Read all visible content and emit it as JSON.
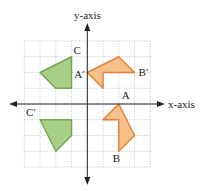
{
  "diagram": {
    "type": "coordinate-plane-transformations",
    "axes": {
      "x_label": "x-axis",
      "y_label": "y-axis",
      "x_range": [
        -4,
        4
      ],
      "y_range": [
        -4,
        4
      ]
    },
    "grid": {
      "cells_x": 8,
      "cells_y": 8,
      "style": "dotted"
    },
    "colors": {
      "green_fill": "#a8cf87",
      "green_stroke": "#6ea84a",
      "orange_fill": "#f5c08a",
      "orange_stroke": "#e57f35",
      "axis": "#222222",
      "grid": "#b8b8b8"
    },
    "shapes": [
      {
        "name": "green-shape-top",
        "color": "green",
        "points": [
          [
            -1,
            3
          ],
          [
            -3,
            2
          ],
          [
            -2,
            1
          ],
          [
            -1,
            1
          ]
        ]
      },
      {
        "name": "orange-shape-top",
        "color": "orange",
        "points": [
          [
            0,
            2
          ],
          [
            2,
            3
          ],
          [
            3,
            2
          ],
          [
            1,
            2
          ],
          [
            1,
            1
          ]
        ]
      },
      {
        "name": "orange-shape-bottom",
        "color": "orange",
        "points": [
          [
            2,
            0
          ],
          [
            3,
            -2
          ],
          [
            2,
            -3
          ],
          [
            2,
            -1
          ],
          [
            1,
            -1
          ]
        ]
      },
      {
        "name": "green-shape-bottom",
        "color": "green",
        "points": [
          [
            -3,
            -1
          ],
          [
            -1,
            -1
          ],
          [
            -1,
            -2
          ],
          [
            -2,
            -3
          ]
        ]
      }
    ],
    "labels": [
      {
        "name": "label-C",
        "text": "C",
        "at": [
          -1,
          3
        ]
      },
      {
        "name": "label-A-prime",
        "text": "A′",
        "at": [
          0,
          2
        ]
      },
      {
        "name": "label-B-prime",
        "text": "B′",
        "at": [
          3,
          2
        ]
      },
      {
        "name": "label-A",
        "text": "A",
        "at": [
          2,
          0
        ]
      },
      {
        "name": "label-B",
        "text": "B",
        "at": [
          2,
          -3
        ]
      },
      {
        "name": "label-C-prime",
        "text": "C′",
        "at": [
          -3,
          -1
        ]
      }
    ]
  }
}
